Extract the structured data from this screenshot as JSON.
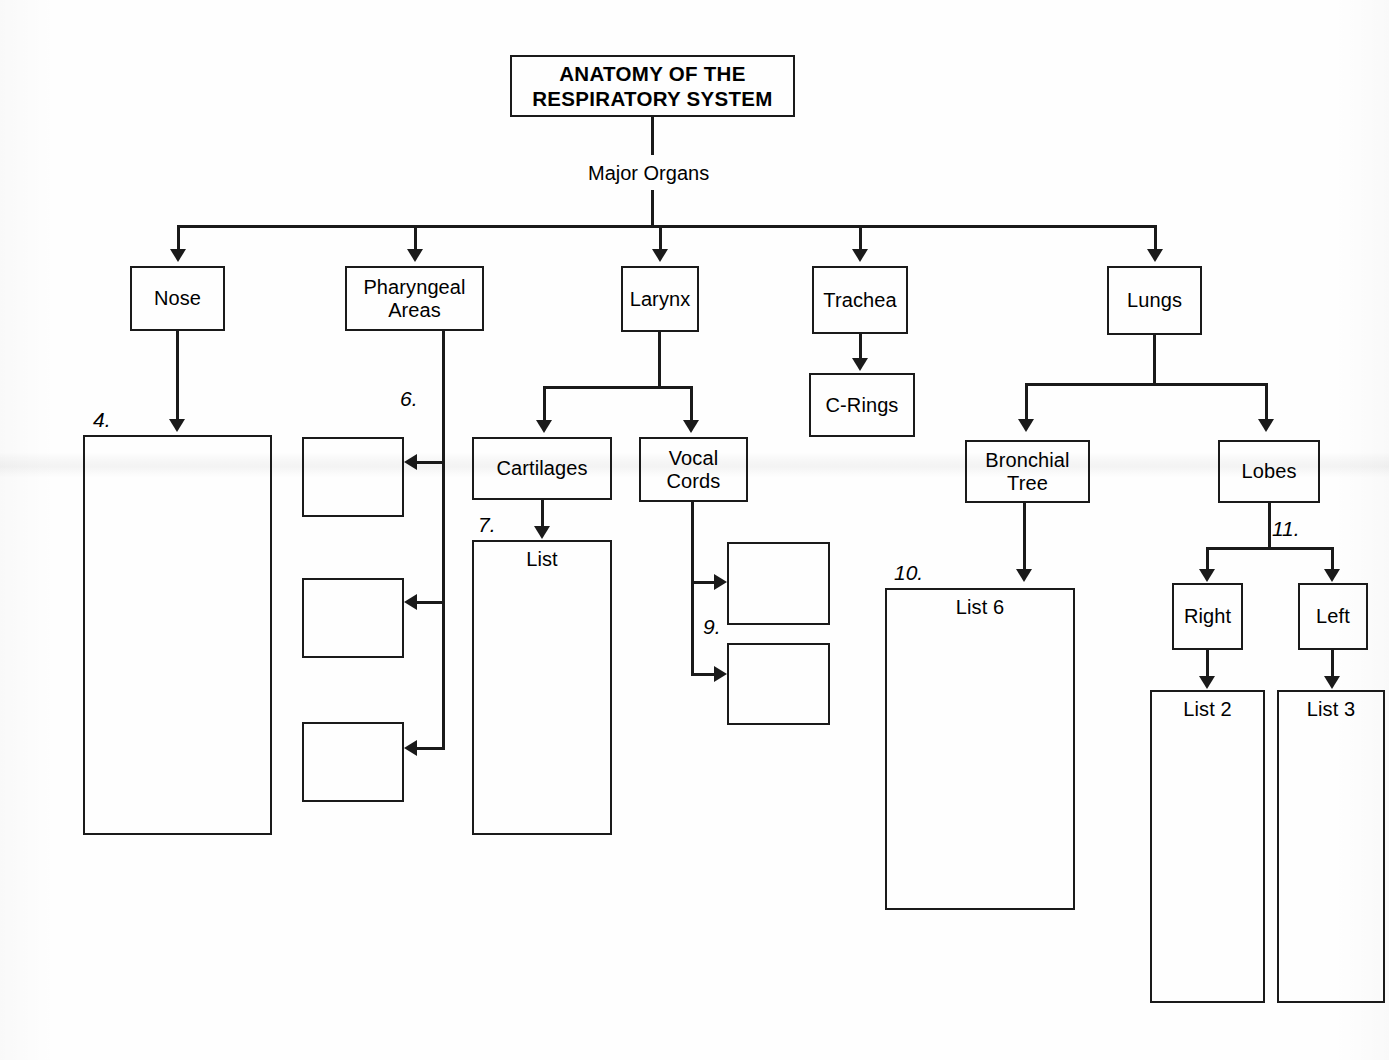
{
  "diagram": {
    "title_line1": "ANATOMY OF THE",
    "title_line2": "RESPIRATORY SYSTEM",
    "root_link_label": "Major Organs"
  },
  "major_organs": {
    "nose": "Nose",
    "pharyngeal_line1": "Pharyngeal",
    "pharyngeal_line2": "Areas",
    "larynx": "Larynx",
    "trachea": "Trachea",
    "lungs": "Lungs"
  },
  "second_level": {
    "c_rings": "C-Rings",
    "cartilages": "Cartilages",
    "vocal_cords_line1": "Vocal",
    "vocal_cords_line2": "Cords",
    "bronchial_tree_line1": "Bronchial",
    "bronchial_tree_line2": "Tree",
    "lobes": "Lobes"
  },
  "third_level": {
    "right": "Right",
    "left": "Left"
  },
  "list_boxes": {
    "cartilages_list": "List",
    "bronchial_list": "List 6",
    "right_lobe_list": "List 2",
    "left_lobe_list": "List 3"
  },
  "callouts": {
    "nose_blank": "4.",
    "pharyngeal_blanks": "6.",
    "cartilages_list": "7.",
    "vocal_cord_blanks": "9.",
    "bronchial_list": "10.",
    "lobes_split": "11."
  },
  "blank_answer_boxes": {
    "nose_detail": "",
    "pharyngeal_1": "",
    "pharyngeal_2": "",
    "pharyngeal_3": "",
    "vocal_cord_1": "",
    "vocal_cord_2": ""
  },
  "colors": {
    "ink": "#1a1a1a",
    "paper": "#fefefe"
  }
}
